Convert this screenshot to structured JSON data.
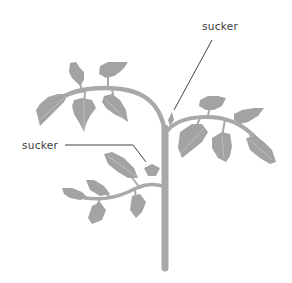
{
  "diagram": {
    "labels": [
      {
        "text": "sucker",
        "target": "upper sucker between main stem and right branch"
      },
      {
        "text": "sucker",
        "target": "lower sucker between main stem and lower-left branch"
      }
    ],
    "colors": {
      "plant": "#a9a9a9",
      "leaf": "#a3a3a3",
      "leaf_vein": "#c4c4c4",
      "leader_line": "#2e2e2e",
      "label_text": "#3a3a3a",
      "background": "#ffffff"
    }
  }
}
